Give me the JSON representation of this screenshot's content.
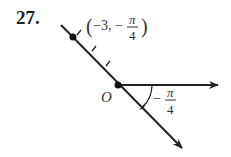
{
  "problem": {
    "number": "27."
  },
  "diagram": {
    "point_label": {
      "open": "(",
      "r": "−3,",
      "neg": "−",
      "num": "π",
      "den": "4",
      "close": ")"
    },
    "origin_label": "O",
    "angle_label": {
      "neg": "−",
      "num": "π",
      "den": "4"
    },
    "ticks": 3
  }
}
